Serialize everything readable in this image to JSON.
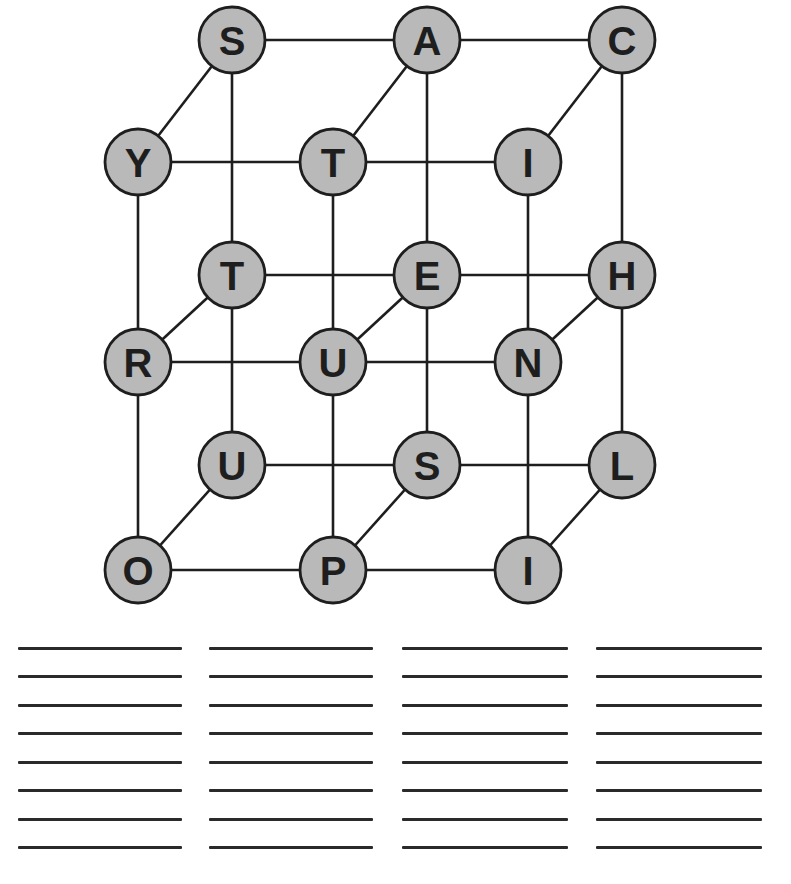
{
  "puzzle": {
    "type": "word-cube",
    "colors": {
      "node_fill": "#b9b9b9",
      "stroke": "#1e1e1e",
      "background": "#ffffff"
    },
    "nodes": [
      {
        "id": "b00",
        "layer": "back",
        "row": 0,
        "col": 0,
        "letter": "S",
        "x": 232,
        "y": 40
      },
      {
        "id": "b01",
        "layer": "back",
        "row": 0,
        "col": 1,
        "letter": "A",
        "x": 427,
        "y": 40
      },
      {
        "id": "b02",
        "layer": "back",
        "row": 0,
        "col": 2,
        "letter": "C",
        "x": 622,
        "y": 40
      },
      {
        "id": "b10",
        "layer": "back",
        "row": 1,
        "col": 0,
        "letter": "T",
        "x": 232,
        "y": 275
      },
      {
        "id": "b11",
        "layer": "back",
        "row": 1,
        "col": 1,
        "letter": "E",
        "x": 427,
        "y": 275
      },
      {
        "id": "b12",
        "layer": "back",
        "row": 1,
        "col": 2,
        "letter": "H",
        "x": 622,
        "y": 275
      },
      {
        "id": "b20",
        "layer": "back",
        "row": 2,
        "col": 0,
        "letter": "U",
        "x": 232,
        "y": 465
      },
      {
        "id": "b21",
        "layer": "back",
        "row": 2,
        "col": 1,
        "letter": "S",
        "x": 427,
        "y": 465
      },
      {
        "id": "b22",
        "layer": "back",
        "row": 2,
        "col": 2,
        "letter": "L",
        "x": 622,
        "y": 465
      },
      {
        "id": "f00",
        "layer": "front",
        "row": 0,
        "col": 0,
        "letter": "Y",
        "x": 138,
        "y": 162
      },
      {
        "id": "f01",
        "layer": "front",
        "row": 0,
        "col": 1,
        "letter": "T",
        "x": 333,
        "y": 162
      },
      {
        "id": "f02",
        "layer": "front",
        "row": 0,
        "col": 2,
        "letter": "I",
        "x": 528,
        "y": 162
      },
      {
        "id": "f10",
        "layer": "front",
        "row": 1,
        "col": 0,
        "letter": "R",
        "x": 138,
        "y": 362
      },
      {
        "id": "f11",
        "layer": "front",
        "row": 1,
        "col": 1,
        "letter": "U",
        "x": 333,
        "y": 362
      },
      {
        "id": "f12",
        "layer": "front",
        "row": 1,
        "col": 2,
        "letter": "N",
        "x": 528,
        "y": 362
      },
      {
        "id": "f20",
        "layer": "front",
        "row": 2,
        "col": 0,
        "letter": "O",
        "x": 138,
        "y": 570
      },
      {
        "id": "f21",
        "layer": "front",
        "row": 2,
        "col": 1,
        "letter": "P",
        "x": 333,
        "y": 570
      },
      {
        "id": "f22",
        "layer": "front",
        "row": 2,
        "col": 2,
        "letter": "I",
        "x": 528,
        "y": 570
      }
    ],
    "edges": [
      [
        "b00",
        "b01"
      ],
      [
        "b01",
        "b02"
      ],
      [
        "b10",
        "b11"
      ],
      [
        "b11",
        "b12"
      ],
      [
        "b20",
        "b21"
      ],
      [
        "b21",
        "b22"
      ],
      [
        "b00",
        "b10"
      ],
      [
        "b10",
        "b20"
      ],
      [
        "b01",
        "b11"
      ],
      [
        "b11",
        "b21"
      ],
      [
        "b02",
        "b12"
      ],
      [
        "b12",
        "b22"
      ],
      [
        "f00",
        "f01"
      ],
      [
        "f01",
        "f02"
      ],
      [
        "f10",
        "f11"
      ],
      [
        "f11",
        "f12"
      ],
      [
        "f20",
        "f21"
      ],
      [
        "f21",
        "f22"
      ],
      [
        "f00",
        "f10"
      ],
      [
        "f10",
        "f20"
      ],
      [
        "f01",
        "f11"
      ],
      [
        "f11",
        "f21"
      ],
      [
        "f02",
        "f12"
      ],
      [
        "f12",
        "f22"
      ],
      [
        "f00",
        "b00"
      ],
      [
        "f01",
        "b01"
      ],
      [
        "f02",
        "b02"
      ],
      [
        "f10",
        "b10"
      ],
      [
        "f11",
        "b11"
      ],
      [
        "f12",
        "b12"
      ],
      [
        "f20",
        "b20"
      ],
      [
        "f21",
        "b21"
      ],
      [
        "f22",
        "b22"
      ]
    ],
    "node_radius": 33
  },
  "answer_area": {
    "columns": 4,
    "rows_per_column": 8,
    "column_x": [
      [
        18,
        182
      ],
      [
        209,
        373
      ],
      [
        402,
        568
      ],
      [
        596,
        762
      ]
    ],
    "row_y": [
      648,
      676,
      705,
      733,
      762,
      790,
      819,
      847
    ],
    "entries": []
  }
}
